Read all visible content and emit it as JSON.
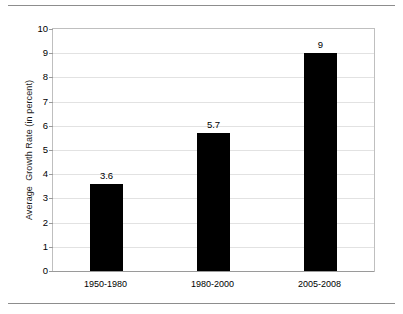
{
  "chart_data": {
    "type": "bar",
    "title": "",
    "subtitle": "",
    "xlabel": "",
    "ylabel": "Average  Growth Rate (in percent)",
    "categories": [
      "1950-1980",
      "1980-2000",
      "2005-2008"
    ],
    "values": [
      3.6,
      5.7,
      9
    ],
    "data_labels": [
      "3.6",
      "5.7",
      "9"
    ],
    "ylim": [
      0,
      10
    ],
    "ytick_step": 1,
    "yticks": [
      "10",
      "9",
      "8",
      "7",
      "6",
      "5",
      "4",
      "3",
      "2",
      "1",
      "0"
    ],
    "grid": true,
    "grid_axis": "y",
    "legend": false,
    "legend_position": "none",
    "bar_color": "#000000",
    "gridline_color": "#e2e2e2",
    "axis_color": "#9a9a9a",
    "plot_border_color": "#bfbfbf",
    "background_color": "#ffffff"
  },
  "page": {
    "rule_color": "#8d8d8d"
  }
}
